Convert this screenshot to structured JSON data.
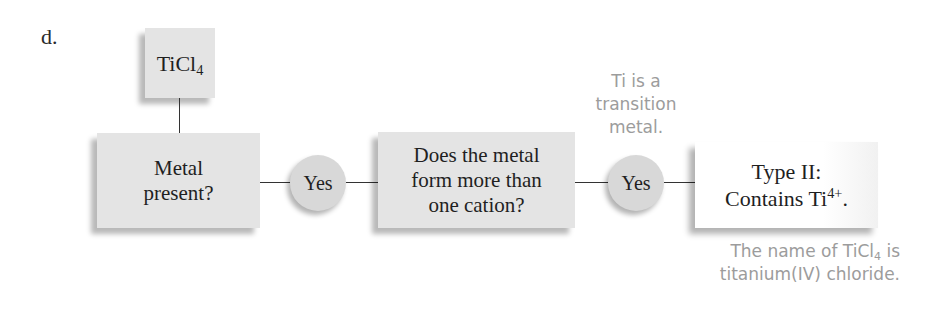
{
  "part_label": "d.",
  "compound": {
    "formula_main": "TiCl",
    "formula_subscript": "4"
  },
  "flowchart": {
    "step1": {
      "line1": "Metal",
      "line2": "present?"
    },
    "answer1": "Yes",
    "step2": {
      "line1": "Does the metal",
      "line2": "form more than",
      "line3": "one cation?"
    },
    "answer2": "Yes",
    "result": {
      "line1": "Type II:",
      "line2_prefix": "Contains Ti",
      "line2_superscript": "4+",
      "line2_suffix": "."
    }
  },
  "annotations": {
    "transition": {
      "line1": "Ti is a",
      "line2": "transition",
      "line3": "metal."
    },
    "name_note": {
      "line1_prefix": "The name of TiCl",
      "line1_subscript": "4",
      "line1_suffix": " is",
      "line2": "titanium(IV) chloride."
    }
  },
  "colors": {
    "box_fill": "#e4e4e4",
    "circle_fill": "#d8d8d8",
    "note_text": "#9c9c9c",
    "line": "#333333"
  }
}
